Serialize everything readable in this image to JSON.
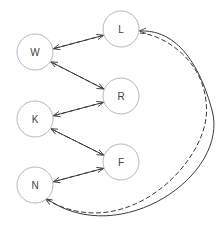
{
  "diagram": {
    "type": "directed-graph",
    "node_radius": 18,
    "nodes": [
      {
        "id": "L",
        "label": "L",
        "x": 121,
        "y": 29
      },
      {
        "id": "W",
        "label": "W",
        "x": 35,
        "y": 52
      },
      {
        "id": "R",
        "label": "R",
        "x": 121,
        "y": 96
      },
      {
        "id": "K",
        "label": "K",
        "x": 35,
        "y": 119
      },
      {
        "id": "F",
        "label": "F",
        "x": 121,
        "y": 162
      },
      {
        "id": "N",
        "label": "N",
        "x": 35,
        "y": 185
      }
    ],
    "edges": [
      {
        "from": "W",
        "to": "L",
        "style": "solid"
      },
      {
        "from": "L",
        "to": "W",
        "style": "dashed"
      },
      {
        "from": "W",
        "to": "R",
        "style": "solid"
      },
      {
        "from": "R",
        "to": "W",
        "style": "dashed"
      },
      {
        "from": "K",
        "to": "R",
        "style": "solid"
      },
      {
        "from": "R",
        "to": "K",
        "style": "dashed"
      },
      {
        "from": "K",
        "to": "F",
        "style": "solid"
      },
      {
        "from": "F",
        "to": "K",
        "style": "dashed"
      },
      {
        "from": "N",
        "to": "F",
        "style": "solid"
      },
      {
        "from": "F",
        "to": "N",
        "style": "dashed"
      },
      {
        "from": "N",
        "to": "L",
        "style": "solid",
        "curved": true
      },
      {
        "from": "L",
        "to": "N",
        "style": "dashed",
        "curved": true
      }
    ],
    "colors": {
      "node_stroke": "#b8b8b8",
      "edge": "#3a3a3a",
      "label": "#444444",
      "background": "#ffffff"
    }
  }
}
